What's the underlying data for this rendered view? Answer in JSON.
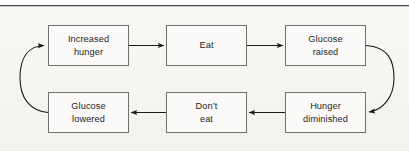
{
  "page": {
    "background_color": "#f6f5f1",
    "rule_color": "#4a4a4a",
    "bleed_text_left": "",
    "bleed_text_right": ""
  },
  "diagram": {
    "type": "cycle-flowchart",
    "title": "",
    "box_border_color": "#6f6f6f",
    "box_fill_color": "#fbfaf8",
    "arrow_color": "#1a1a1a",
    "text_color": "#1d1d1d",
    "nodes": [
      {
        "id": "increased-hunger",
        "label": "Increased\nhunger",
        "row": "top",
        "col": 1,
        "x": 48,
        "y": 25,
        "w": 81,
        "h": 41
      },
      {
        "id": "eat",
        "label": "Eat",
        "row": "top",
        "col": 2,
        "x": 166,
        "y": 25,
        "w": 81,
        "h": 41
      },
      {
        "id": "glucose-raised",
        "label": "Glucose\nraised",
        "row": "top",
        "col": 3,
        "x": 285,
        "y": 25,
        "w": 81,
        "h": 41
      },
      {
        "id": "glucose-lowered",
        "label": "Glucose\nlowered",
        "row": "bottom",
        "col": 1,
        "x": 48,
        "y": 92,
        "w": 81,
        "h": 41
      },
      {
        "id": "dont-eat",
        "label": "Don’t\neat",
        "row": "bottom",
        "col": 2,
        "x": 166,
        "y": 92,
        "w": 81,
        "h": 41
      },
      {
        "id": "hunger-diminished",
        "label": "Hunger\ndiminished",
        "row": "bottom",
        "col": 3,
        "x": 285,
        "y": 92,
        "w": 81,
        "h": 41
      }
    ],
    "edges": [
      {
        "id": "edge-hunger-to-eat",
        "from": "increased-hunger",
        "to": "eat",
        "shape": "straight",
        "direction": "right"
      },
      {
        "id": "edge-eat-to-glucose-raised",
        "from": "eat",
        "to": "glucose-raised",
        "shape": "straight",
        "direction": "right"
      },
      {
        "id": "edge-raised-to-diminished",
        "from": "glucose-raised",
        "to": "hunger-diminished",
        "shape": "curve",
        "direction": "down-right"
      },
      {
        "id": "edge-diminished-to-dont-eat",
        "from": "hunger-diminished",
        "to": "dont-eat",
        "shape": "straight",
        "direction": "left"
      },
      {
        "id": "edge-dont-eat-to-lowered",
        "from": "dont-eat",
        "to": "glucose-lowered",
        "shape": "straight",
        "direction": "left"
      },
      {
        "id": "edge-lowered-to-hunger",
        "from": "glucose-lowered",
        "to": "increased-hunger",
        "shape": "curve",
        "direction": "up-left"
      }
    ]
  }
}
